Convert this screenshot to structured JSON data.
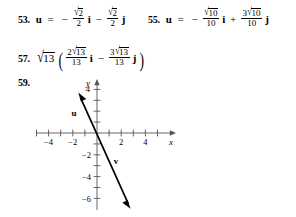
{
  "page": {
    "kind": "textbook-answer-key",
    "background": "#ffffff",
    "ink": "#000000"
  },
  "answers": [
    {
      "number": "53.",
      "variable": "u",
      "equals": "=",
      "terms": [
        {
          "sign": "−",
          "coefficient": {
            "numerator_radicand": "2",
            "numerator_prefix": "",
            "denominator": "2"
          },
          "unit": "i"
        },
        {
          "sign": "−",
          "coefficient": {
            "numerator_radicand": "2",
            "numerator_prefix": "",
            "denominator": "2"
          },
          "unit": "j"
        }
      ]
    },
    {
      "number": "55.",
      "variable": "u",
      "equals": "=",
      "terms": [
        {
          "sign": "−",
          "coefficient": {
            "numerator_radicand": "10",
            "numerator_prefix": "",
            "denominator": "10"
          },
          "unit": "i"
        },
        {
          "sign": "+",
          "coefficient": {
            "numerator_radicand": "10",
            "numerator_prefix": "3",
            "denominator": "10"
          },
          "unit": "j"
        }
      ]
    },
    {
      "number": "57.",
      "outer_radicand": "13",
      "open_paren": "(",
      "close_paren": ")",
      "terms": [
        {
          "sign": "",
          "coefficient": {
            "numerator_radicand": "13",
            "numerator_prefix": "2",
            "denominator": "13"
          },
          "unit": "i"
        },
        {
          "sign": "−",
          "coefficient": {
            "numerator_radicand": "13",
            "numerator_prefix": "3",
            "denominator": "13"
          },
          "unit": "j"
        }
      ]
    },
    {
      "number": "59."
    }
  ],
  "graph": {
    "x_axis_label": "x",
    "y_axis_label": "y",
    "x_tick_labels": [
      "−4",
      "−2",
      "2",
      "4"
    ],
    "x_tick_values": [
      -4,
      -2,
      2,
      4
    ],
    "y_tick_labels": [
      "4",
      "−2",
      "−4",
      "−6"
    ],
    "y_tick_values": [
      4,
      -2,
      -4,
      -6
    ],
    "x_range": [
      -5.6,
      5.6
    ],
    "y_range": [
      -7.2,
      5.0
    ],
    "x_minor_ticks": [
      -5,
      -4,
      -3,
      -2,
      -1,
      1,
      2,
      3,
      4,
      5
    ],
    "y_minor_ticks": [
      1,
      2,
      3,
      4,
      -1,
      -2,
      -3,
      -4,
      -5,
      -6
    ],
    "vectors": [
      {
        "name": "u",
        "label": "u",
        "tail": [
          -1.0,
          2.6
        ],
        "head": [
          -1.35,
          3.2
        ],
        "label_at": [
          -1.9,
          2.0
        ],
        "arrow": "head-up-left"
      },
      {
        "name": "v",
        "label": "v",
        "tail": [
          -1.0,
          2.6
        ],
        "head": [
          2.55,
          -6.4
        ],
        "label_at": [
          1.55,
          -2.6
        ],
        "arrow": "head-down-right"
      }
    ],
    "line_color": "#000000",
    "axis_color": "#4a4a4a"
  }
}
